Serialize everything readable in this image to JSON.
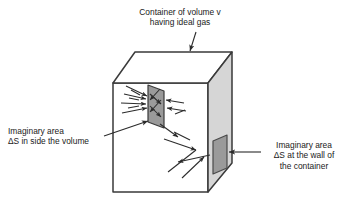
{
  "figure": {
    "type": "physics-diagram"
  },
  "labels": {
    "top": {
      "line1": "Container of volume v",
      "line2": "having ideal gas"
    },
    "inside": {
      "line1": "Imaginary area",
      "line2": "ΔS in side the volume"
    },
    "wall": {
      "line1": "Imaginary area",
      "line2": "ΔS at the wall of",
      "line3": "the container"
    }
  },
  "colors": {
    "outline": "#333333",
    "side_face": "#d6d6d6",
    "inner_area": "#9a9a9a",
    "wall_area": "#9a9a9a",
    "front_face": "#ffffff",
    "top_face": "#ffffff",
    "text": "#1a1a1a",
    "arrow": "#2b2b2b"
  },
  "geometry": {
    "cube": {
      "front_face": "113,83 208,83 208,192 113,192",
      "top_face": "113,83 135,52 232,52 208,83",
      "right_face": "208,83 232,52 232,163 208,192"
    },
    "inner_area_quad": "148,85 163,90 163,127 148,122",
    "wall_area_quad": "214,141 227,136 227,168 214,173"
  }
}
